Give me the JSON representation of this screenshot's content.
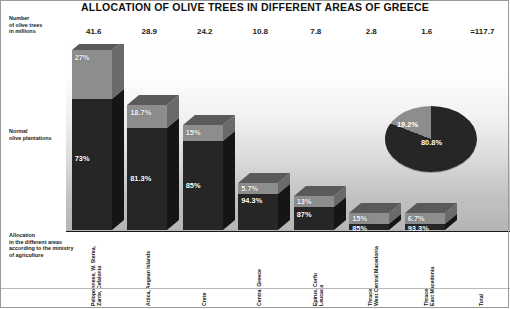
{
  "chart": {
    "title": "ALLOCATION OF OLIVE TREES IN DIFFERENT AREAS OF GREECE",
    "y_axis_caption": {
      "line1": "Number",
      "line2": "of olive trees",
      "line3": "in millions"
    },
    "series_label_normal": {
      "line1": "Normal",
      "line2": "olive plantations"
    },
    "series_label_allocation": {
      "line1": "Allocation",
      "line2": "in the different areas",
      "line3": "according to the ministry",
      "line4": "of agriculture"
    }
  },
  "chart_data": {
    "type": "bar",
    "title": "ALLOCATION OF OLIVE TREES IN DIFFERENT AREAS OF GREECE",
    "subtitle": "",
    "xlabel": "",
    "ylabel": "Number of olive trees in millions",
    "grid": false,
    "legend_position": "left-axis-annotations",
    "stacked": true,
    "categories": [
      "Peloponnese, W. Sterea, Zante, Cefalonia",
      "Attica, Aegean Islands",
      "Crete",
      "Central Greece",
      "Epirus, Corfu Leucada",
      "Thrace, West Central Macedonia",
      "Thrace, East Macedonia",
      "Total"
    ],
    "category_lines": [
      [
        "Peloponnese, W. Sterea,",
        "Zante, Cefalonia"
      ],
      [
        "Attica, Aegean Islands"
      ],
      [
        "Crete"
      ],
      [
        "Central Greece"
      ],
      [
        "Epirus, Corfu",
        "Leucada"
      ],
      [
        "Thrace,",
        "West Central Macedonia"
      ],
      [
        "Thrace,",
        "East Macedonia"
      ],
      [
        "Total"
      ]
    ],
    "totals_millions": [
      "41.6",
      "28.9",
      "24.2",
      "10.8",
      "7.8",
      "2.8",
      "1.6",
      "=117.7"
    ],
    "totals_values": [
      41.6,
      28.9,
      24.2,
      10.8,
      7.8,
      2.8,
      1.6,
      117.7
    ],
    "series": [
      {
        "name": "Allocation in the different areas according to the ministry of agriculture",
        "color": "#8d8d8d",
        "labels": [
          "27%",
          "18.7%",
          "15%",
          "5.7%",
          "13%",
          "15%",
          "6.7%",
          "19.2%"
        ],
        "values": [
          27,
          18.7,
          15,
          5.7,
          13,
          15,
          6.7,
          19.2
        ]
      },
      {
        "name": "Normal olive plantations",
        "color": "#262626",
        "labels": [
          "73%",
          "81.3%",
          "85%",
          "94.3%",
          "87%",
          "85%",
          "93.3%",
          "80.8%"
        ],
        "values": [
          73,
          81.3,
          85,
          94.3,
          87,
          85,
          93.3,
          80.8
        ]
      }
    ],
    "total_chart": {
      "type": "pie",
      "labels": [
        "19.2%",
        "80.8%"
      ],
      "values": [
        19.2,
        80.8
      ],
      "colors": [
        "#8d8d8d",
        "#262626"
      ]
    }
  }
}
